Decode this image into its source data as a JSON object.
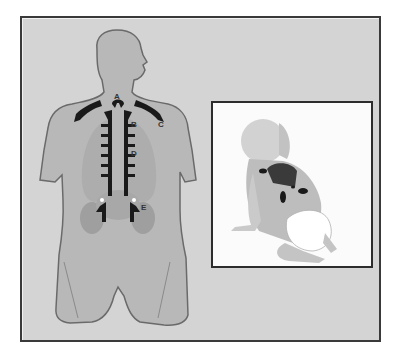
{
  "diagram": {
    "type": "anatomical-illustration",
    "main_figure": {
      "description": "Adult torso viewed from the back, head turned to the right, with highlighted regions along the spine and shoulders",
      "labels": [
        {
          "id": "A",
          "text": "A",
          "position": "base of neck"
        },
        {
          "id": "B",
          "text": "B",
          "position": "upper thoracic spine, right side"
        },
        {
          "id": "C",
          "text": "C",
          "position": "right shoulder / trapezius"
        },
        {
          "id": "D",
          "text": "D",
          "position": "mid thoracic spine, right side"
        },
        {
          "id": "E",
          "text": "E",
          "position": "lumbar region, right side"
        }
      ]
    },
    "inset": {
      "description": "Infant in a diaper crawling, viewed from behind, with dark highlighted regions on the upper back and lower back"
    },
    "colors": {
      "background": "#d4d4d4",
      "body": "#b8b8b8",
      "body_outline": "#6a6a6a",
      "organs": "#a5a5a5",
      "highlight": "#1a1a1a",
      "inset_background": "#fbfbfb",
      "frame_border": "#3a3a3a"
    }
  }
}
